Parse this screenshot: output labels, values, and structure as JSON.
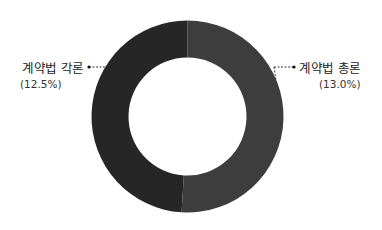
{
  "chart_data": {
    "type": "pie",
    "variant": "donut",
    "title": "",
    "slices": [
      {
        "name": "계약법 총론",
        "value": 13.0,
        "label": "(13.0%)",
        "color": "#3d3d3d",
        "side": "right"
      },
      {
        "name": "계약법 각론",
        "value": 12.5,
        "label": "(12.5%)",
        "color": "#262626",
        "side": "left"
      }
    ],
    "legend": "none",
    "background": "#ffffff"
  }
}
